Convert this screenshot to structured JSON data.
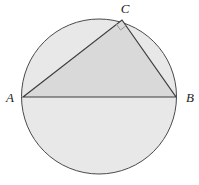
{
  "figure": {
    "background": "#ffffff",
    "circle": {
      "cx": 99,
      "cy": 96.5,
      "r": 77.5,
      "fill": "#e8e8e8",
      "stroke": "#4a4a4a",
      "stroke_width": 1
    },
    "triangle": {
      "vertices": [
        "A",
        "C",
        "B"
      ],
      "fill": "#d9d9d9",
      "stroke": "#3d3d3d",
      "stroke_width": 1.2
    },
    "points": {
      "A": {
        "x": 23,
        "y": 97,
        "label": "A",
        "label_dx": -9,
        "label_dy": 5,
        "anchor": "end"
      },
      "B": {
        "x": 176,
        "y": 97,
        "label": "B",
        "label_dx": 10,
        "label_dy": 5,
        "anchor": "start"
      },
      "C": {
        "x": 122,
        "y": 20,
        "label": "C",
        "label_dx": 3,
        "label_dy": -7,
        "anchor": "middle"
      }
    },
    "right_angle": {
      "vertex": "C",
      "toward": [
        "A",
        "B"
      ],
      "size": 7,
      "stroke": "#9a9a9a",
      "stroke_width": 1,
      "fill": "none"
    }
  }
}
